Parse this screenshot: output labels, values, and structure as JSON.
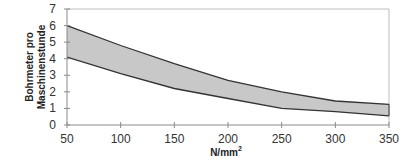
{
  "chart_data": {
    "type": "area",
    "title": "",
    "xlabel": "N/mm²",
    "xlabel_base": "N/mm",
    "xlabel_sup": "2",
    "ylabel_lines": [
      "Bohrmeter pro",
      "Maschinenstunde"
    ],
    "ylabel": "Bohrmeter pro Maschinenstunde",
    "xlim": [
      50,
      350
    ],
    "ylim": [
      0,
      7
    ],
    "x_ticks": [
      50,
      100,
      150,
      200,
      250,
      300,
      350
    ],
    "y_ticks": [
      0,
      1,
      2,
      3,
      4,
      5,
      6,
      7
    ],
    "grid": false,
    "legend": null,
    "x": [
      50,
      100,
      150,
      200,
      250,
      300,
      350
    ],
    "series": [
      {
        "name": "upper bound",
        "values": [
          6.0,
          4.8,
          3.7,
          2.7,
          2.0,
          1.45,
          1.25
        ]
      },
      {
        "name": "lower bound",
        "values": [
          4.1,
          3.1,
          2.2,
          1.6,
          1.0,
          0.8,
          0.55
        ]
      }
    ],
    "band_fill": "#c8c8c8",
    "line_color": "#333333",
    "frame_color": "#bdbdbd",
    "axis_color": "#8a8a8a"
  }
}
